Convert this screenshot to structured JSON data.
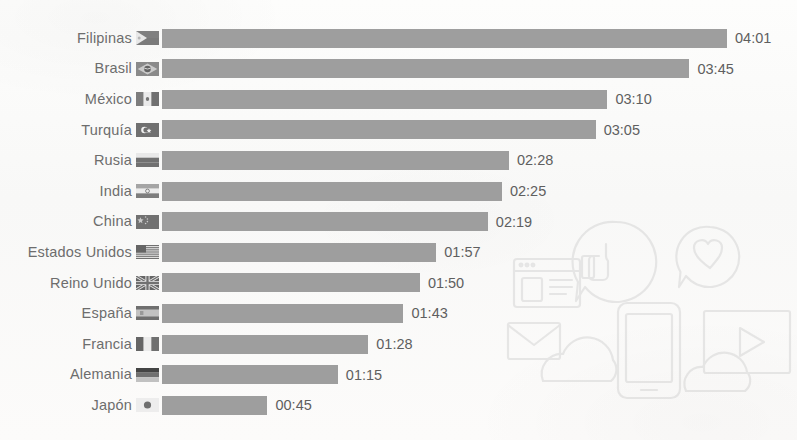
{
  "chart_data": {
    "type": "bar",
    "orientation": "horizontal",
    "title": "",
    "subtitle": "",
    "xlabel": "",
    "ylabel": "",
    "grid": false,
    "legend": false,
    "value_format": "hh:mm",
    "categories": [
      "Filipinas",
      "Brasil",
      "México",
      "Turquía",
      "Rusia",
      "India",
      "China",
      "Estados Unidos",
      "Reino Unido",
      "España",
      "Francia",
      "Alemania",
      "Japón"
    ],
    "value_labels": [
      "04:01",
      "03:45",
      "03:10",
      "03:05",
      "02:28",
      "02:25",
      "02:19",
      "01:57",
      "01:50",
      "01:43",
      "01:28",
      "01:15",
      "00:45"
    ],
    "values_minutes": [
      241,
      225,
      190,
      185,
      148,
      145,
      139,
      117,
      110,
      103,
      88,
      75,
      45
    ],
    "xlim": [
      0,
      241
    ],
    "rows": [
      {
        "country": "Filipinas",
        "flag": "flag-philippines-icon",
        "value": "04:01",
        "minutes": 241
      },
      {
        "country": "Brasil",
        "flag": "flag-brazil-icon",
        "value": "03:45",
        "minutes": 225
      },
      {
        "country": "México",
        "flag": "flag-mexico-icon",
        "value": "03:10",
        "minutes": 190
      },
      {
        "country": "Turquía",
        "flag": "flag-turkey-icon",
        "value": "03:05",
        "minutes": 185
      },
      {
        "country": "Rusia",
        "flag": "flag-russia-icon",
        "value": "02:28",
        "minutes": 148
      },
      {
        "country": "India",
        "flag": "flag-india-icon",
        "value": "02:25",
        "minutes": 145
      },
      {
        "country": "China",
        "flag": "flag-china-icon",
        "value": "02:19",
        "minutes": 139
      },
      {
        "country": "Estados Unidos",
        "flag": "flag-usa-icon",
        "value": "01:57",
        "minutes": 117
      },
      {
        "country": "Reino Unido",
        "flag": "flag-uk-icon",
        "value": "01:50",
        "minutes": 110
      },
      {
        "country": "España",
        "flag": "flag-spain-icon",
        "value": "01:43",
        "minutes": 103
      },
      {
        "country": "Francia",
        "flag": "flag-france-icon",
        "value": "01:28",
        "minutes": 88
      },
      {
        "country": "Alemania",
        "flag": "flag-germany-icon",
        "value": "01:15",
        "minutes": 75
      },
      {
        "country": "Japón",
        "flag": "flag-japan-icon",
        "value": "00:45",
        "minutes": 45
      }
    ]
  },
  "style": {
    "bar_color": "#9b9b9b",
    "label_color": "#6d6d6d",
    "value_color": "#5f5f5f",
    "background_color": "#fbfbfa"
  },
  "watermark": {
    "icons": [
      "thumbs-up-speech-bubble-icon",
      "heart-speech-bubble-icon",
      "browser-window-icon",
      "envelope-icon",
      "cloud-left-icon",
      "smartphone-icon",
      "cloud-right-icon",
      "video-play-screen-icon"
    ]
  }
}
